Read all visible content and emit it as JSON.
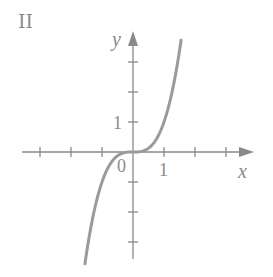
{
  "panel_label": "II",
  "colors": {
    "axis": "#8a8a8a",
    "curve": "#9a9a9a",
    "text": "#8a8a8a",
    "background": "#ffffff"
  },
  "chart_data": {
    "type": "line",
    "title": "",
    "panel": "II",
    "xlabel": "x",
    "ylabel": "y",
    "origin_label": "0",
    "x_tick_label": "1",
    "y_tick_label": "1",
    "xlim": [
      -3.1,
      3.9
    ],
    "ylim": [
      -3.5,
      4.0
    ],
    "x_ticks": [
      -3,
      -2,
      -1,
      1,
      2,
      3
    ],
    "y_ticks": [
      -3,
      -2,
      -1,
      1,
      2,
      3
    ],
    "grid": false,
    "legend": null,
    "series": [
      {
        "name": "curve",
        "function": "y = x^3",
        "x": [
          -1.55,
          -1.25,
          -1.0,
          -0.75,
          -0.5,
          -0.25,
          0,
          0.25,
          0.5,
          0.75,
          1.0,
          1.25,
          1.55
        ],
        "y": [
          -3.72,
          -1.95,
          -1.0,
          -0.42,
          -0.125,
          -0.016,
          0,
          0.016,
          0.125,
          0.42,
          1.0,
          1.95,
          3.72
        ]
      }
    ]
  }
}
